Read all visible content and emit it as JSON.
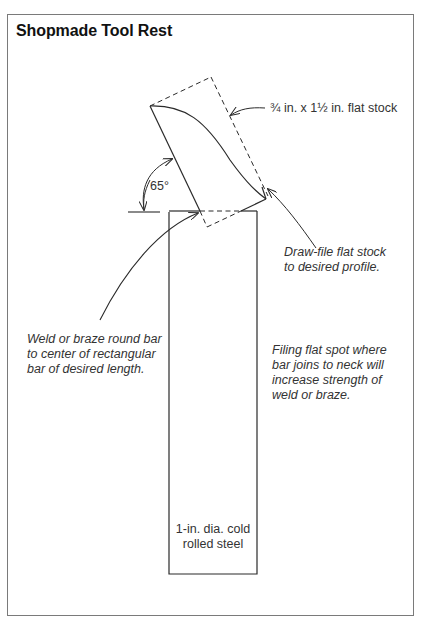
{
  "figure": {
    "title": "Shopmade Tool Rest",
    "angle_label": "65°",
    "annotations": {
      "flat_stock": "¾ in. x 1½ in. flat stock",
      "draw_file": [
        "Draw-file flat stock",
        "to desired profile."
      ],
      "weld": [
        "Weld or braze round bar",
        "to center of rectangular",
        "bar of desired length."
      ],
      "filing": [
        "Filing flat spot where",
        "bar joins to neck will",
        "increase strength of",
        "weld or braze."
      ],
      "steel": [
        "1-in. dia. cold",
        "rolled steel"
      ]
    },
    "colors": {
      "line": "#2a2a2a",
      "frame": "#7a7a7a",
      "background": "#ffffff"
    }
  }
}
